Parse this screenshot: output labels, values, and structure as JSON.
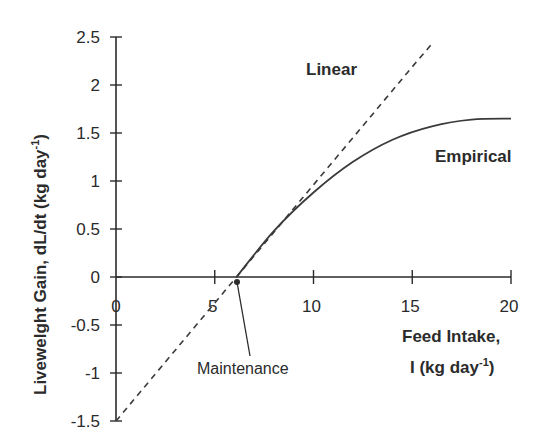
{
  "chart_data": {
    "type": "line",
    "title": "",
    "xlabel_line1": "Feed Intake,",
    "xlabel_line2": "I (kg day",
    "xlabel_sup": "-1",
    "xlabel_close": ")",
    "ylabel": "Livewelght Gain, dL/dt (kg day",
    "ylabel_sup": "-1",
    "ylabel_close": ")",
    "xlim": [
      0,
      20
    ],
    "ylim": [
      -1.5,
      2.5
    ],
    "x_ticks": [
      "0",
      "5",
      "10",
      "15",
      "20"
    ],
    "y_ticks": [
      "2.5",
      "2",
      "1.5",
      "1",
      "0.5",
      "0",
      "-0.5",
      "-1",
      "-1.5"
    ],
    "grid": false,
    "legend_position": "inline labels",
    "series": [
      {
        "name": "Linear",
        "style": "dashed",
        "x": [
          0,
          6.1,
          10,
          15,
          16
        ],
        "y": [
          -1.5,
          0,
          0.96,
          2.19,
          2.43
        ]
      },
      {
        "name": "Empirical",
        "style": "solid",
        "x": [
          6.1,
          8,
          10,
          12,
          14,
          16,
          18,
          20
        ],
        "y": [
          0,
          0.48,
          0.88,
          1.2,
          1.43,
          1.57,
          1.64,
          1.65
        ]
      }
    ],
    "annotations": [
      {
        "text": "Maintenance",
        "x": 6.1,
        "y": 0
      },
      {
        "text": "Linear",
        "x": 10,
        "y": 2.1
      },
      {
        "text": "Empirical",
        "x": 18,
        "y": 1.25
      }
    ]
  },
  "labels": {
    "linear": "Linear",
    "empirical": "Empirical",
    "maintenance": "Maintenance"
  },
  "colors": {
    "ink": "#2b2b2b",
    "background": "#ffffff"
  }
}
